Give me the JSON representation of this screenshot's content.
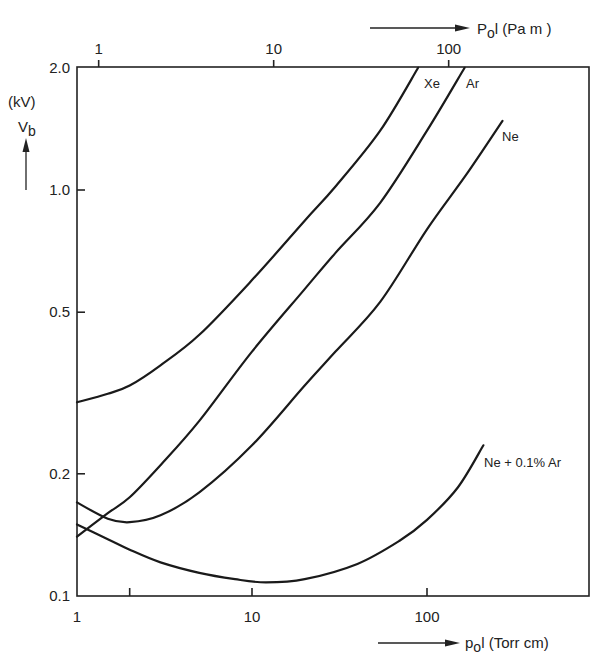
{
  "chart_data": {
    "type": "line",
    "title": "",
    "xlabel": "p₀l (Torr cm)",
    "xlabel_top": "P₀l (Pa m)",
    "ylabel": "V_b",
    "ylabel_unit": "(kV)",
    "xscale": "log",
    "yscale": "log",
    "xlim": [
      1,
      800
    ],
    "ylim": [
      0.1,
      2.0
    ],
    "grid": false,
    "legend": "inline labels at curve ends",
    "x_ticks": [
      {
        "value": 1,
        "label": "1"
      },
      {
        "value": 2,
        "label": ""
      },
      {
        "value": 10,
        "label": "10"
      },
      {
        "value": 100,
        "label": "100"
      }
    ],
    "x_ticks_top": [
      {
        "value": 1.33,
        "label": "1"
      },
      {
        "value": 13.3,
        "label": "10"
      },
      {
        "value": 133,
        "label": "100"
      }
    ],
    "y_ticks": [
      {
        "value": 0.1,
        "label": "0.1"
      },
      {
        "value": 0.2,
        "label": "0.2"
      },
      {
        "value": 0.5,
        "label": "0.5"
      },
      {
        "value": 1.0,
        "label": "1.0"
      },
      {
        "value": 2.0,
        "label": "2.0"
      }
    ],
    "series": [
      {
        "name": "Xe",
        "label": "Xe",
        "x": [
          1,
          1.5,
          2,
          3,
          5,
          10,
          20,
          30,
          54,
          89
        ],
        "y": [
          0.3,
          0.315,
          0.33,
          0.37,
          0.44,
          0.6,
          0.84,
          1.02,
          1.4,
          2.0
        ],
        "label_pos": [
          424,
          88
        ]
      },
      {
        "name": "Ar",
        "label": "Ar",
        "x": [
          1,
          1.5,
          2,
          3,
          5,
          10,
          20,
          30,
          54,
          100,
          164
        ],
        "y": [
          0.14,
          0.16,
          0.175,
          0.21,
          0.27,
          0.4,
          0.57,
          0.7,
          0.93,
          1.4,
          2.0
        ],
        "label_pos": [
          466,
          88
        ]
      },
      {
        "name": "Ne",
        "label": "Ne",
        "x": [
          1,
          1.5,
          2,
          3,
          5,
          10,
          20,
          30,
          54,
          100,
          170,
          270
        ],
        "y": [
          0.17,
          0.155,
          0.152,
          0.158,
          0.18,
          0.235,
          0.33,
          0.4,
          0.53,
          0.8,
          1.1,
          1.48
        ],
        "label_pos": [
          502,
          141
        ]
      },
      {
        "name": "Ne + 0.1% Ar",
        "label": "Ne + 0.1% Ar",
        "x": [
          1,
          1.5,
          2,
          3,
          5,
          8,
          12,
          20,
          40,
          70,
          100,
          150,
          210
        ],
        "y": [
          0.15,
          0.138,
          0.13,
          0.121,
          0.114,
          0.11,
          0.108,
          0.11,
          0.12,
          0.137,
          0.154,
          0.185,
          0.235
        ],
        "label_pos": [
          484,
          467
        ]
      }
    ]
  },
  "axes": {
    "y_unit": "(kV)",
    "y_symbol": "V",
    "y_subscript": "b",
    "x_bottom_symbol": "p",
    "x_bottom_subscript": "o",
    "x_bottom_rest": "l (Torr cm)",
    "x_top_symbol": "P",
    "x_top_subscript": "o",
    "x_top_rest": "l (Pa  m )"
  }
}
